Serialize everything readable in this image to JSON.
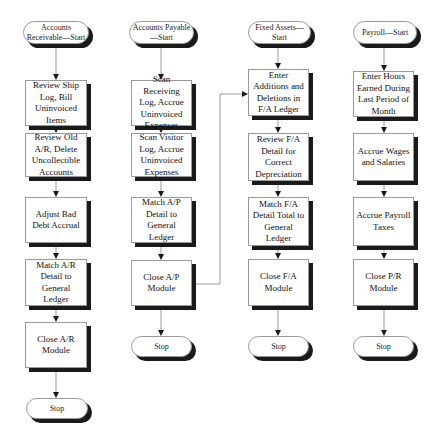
{
  "diagram": {
    "type": "flowchart",
    "columns": [
      {
        "id": "ar",
        "start": "Accounts Receivable—Start",
        "steps": [
          "Review Ship Log, Bill Uninvoiced Items",
          "Review Old A/R, Delete Uncollectible Accounts",
          "Adjust Bad Debt Accrual",
          "Match A/R Detail to General Ledger",
          "Close A/R Module"
        ],
        "end": "Stop"
      },
      {
        "id": "ap",
        "start": "Accounts Payable—Start",
        "steps": [
          "Scan Receiving Log, Accrue Uninvoiced Expenses",
          "Scan Visitor Log, Accrue Uninvoiced Expenses",
          "Match A/P Detail to General Ledger",
          "Close A/P Module"
        ],
        "end": "Stop"
      },
      {
        "id": "fa",
        "start": "Fixed Assets—Start",
        "steps": [
          "Enter Additions and Deletions in F/A Ledger",
          "Review F/A Detail for Correct Depreciation",
          "Match F/A Detail Total to General Ledger",
          "Close F/A Module"
        ],
        "end": "Stop"
      },
      {
        "id": "pr",
        "start": "Payroll—Start",
        "steps": [
          "Enter Hours Earned During Last Period of Month",
          "Accrue Wages and Salaries",
          "Accrue Payroll Taxes",
          "Close P/R Module"
        ],
        "end": "Stop"
      }
    ],
    "cross_links": [
      {
        "from": "Close A/P Module",
        "to": "Enter Additions and Deletions in F/A Ledger"
      }
    ],
    "colors": {
      "border": "#9a9a9a",
      "shadow": "#1a1a1a",
      "line": "#9a9a9a",
      "arrow": "#1a1a1a"
    }
  }
}
